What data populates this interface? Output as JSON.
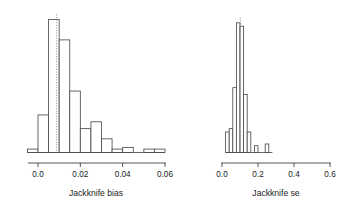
{
  "figure": {
    "background": "#ffffff",
    "bar_fill": "#ffffff",
    "bar_stroke": "#4d4d4d",
    "axis_color": "#444444",
    "refline_color": "#808080"
  },
  "chart_data": [
    {
      "type": "bar",
      "subtype": "histogram",
      "panel": "left",
      "title": "",
      "xlabel": "Jackknife bias",
      "ylabel": "",
      "xlim": [
        -0.005,
        0.0625
      ],
      "ylim": [
        0,
        80
      ],
      "grid": false,
      "legend": null,
      "bin_width": 0.005,
      "bin_edges": [
        -0.005,
        0.0,
        0.005,
        0.01,
        0.015,
        0.02,
        0.025,
        0.03,
        0.035,
        0.04,
        0.045,
        0.05,
        0.055,
        0.06
      ],
      "bin_counts": [
        2,
        22,
        78,
        66,
        36,
        14,
        18,
        8,
        2,
        3,
        0,
        2,
        2
      ],
      "xticks": [
        0.0,
        0.02,
        0.04,
        0.06
      ],
      "xticklabels": [
        "0.0",
        "0.02",
        "0.04",
        "0.06"
      ],
      "annotations": [
        {
          "kind": "vertical-reference-line",
          "x": 0.0088,
          "style": "dotted"
        }
      ]
    },
    {
      "type": "bar",
      "subtype": "histogram",
      "panel": "right",
      "title": "",
      "xlabel": "Jackknife se",
      "ylabel": "",
      "xlim": [
        0.0,
        0.62
      ],
      "ylim": [
        0,
        80
      ],
      "grid": false,
      "legend": null,
      "bin_width": 0.02,
      "bin_edges": [
        0.02,
        0.04,
        0.06,
        0.08,
        0.1,
        0.12,
        0.14,
        0.16,
        0.18,
        0.2,
        0.22,
        0.24,
        0.26,
        0.28
      ],
      "bin_counts": [
        12,
        14,
        38,
        76,
        74,
        34,
        12,
        0,
        4,
        0,
        0,
        5,
        0
      ],
      "xticks": [
        0.0,
        0.2,
        0.4,
        0.6
      ],
      "xticklabels": [
        "0.0",
        "0.2",
        "0.4",
        "0.6"
      ],
      "annotations": [
        {
          "kind": "vertical-reference-line",
          "x": 0.102,
          "style": "dotted"
        }
      ]
    }
  ],
  "left_panel": {
    "xlabel": "Jackknife bias",
    "ticklabels": [
      "0.0",
      "0.02",
      "0.04",
      "0.06"
    ]
  },
  "right_panel": {
    "xlabel": "Jackknife se",
    "ticklabels": [
      "0.0",
      "0.2",
      "0.4",
      "0.6"
    ]
  }
}
